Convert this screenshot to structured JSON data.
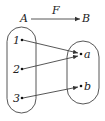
{
  "diagram": {
    "type": "set-mapping",
    "header": {
      "from": "A",
      "mapping": "F",
      "to": "B"
    },
    "set_a": {
      "name": "A",
      "elements": [
        "1",
        "2",
        "3"
      ]
    },
    "set_b": {
      "name": "B",
      "elements": [
        "a",
        "b"
      ]
    },
    "mappings": [
      {
        "from": "1",
        "to": "a"
      },
      {
        "from": "2",
        "to": "a"
      },
      {
        "from": "3",
        "to": "b"
      }
    ],
    "colors": {
      "line": "#444444",
      "text": "#222222",
      "background": "#ffffff"
    }
  }
}
